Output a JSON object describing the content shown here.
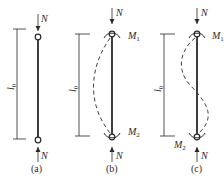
{
  "figure": {
    "panels": [
      {
        "id": "a",
        "caption": "(a)",
        "top_force": "N",
        "bottom_force": "N",
        "length_label": "l",
        "length_sub": "0",
        "top_moment": "",
        "bottom_moment": "",
        "buckled_shape": "none"
      },
      {
        "id": "b",
        "caption": "(b)",
        "top_force": "N",
        "bottom_force": "N",
        "length_label": "l",
        "length_sub": "0",
        "top_moment": "M",
        "top_moment_sub": "1",
        "bottom_moment": "M",
        "bottom_moment_sub": "2",
        "buckled_shape": "single curvature"
      },
      {
        "id": "c",
        "caption": "(c)",
        "top_force": "N",
        "bottom_force": "N",
        "length_label": "l",
        "length_sub": "0",
        "top_moment": "M",
        "top_moment_sub": "1",
        "bottom_moment": "M",
        "bottom_moment_sub": "2",
        "buckled_shape": "double curvature"
      }
    ],
    "colors": {
      "line": "#2a2a2a",
      "background": "#ffffff"
    }
  }
}
